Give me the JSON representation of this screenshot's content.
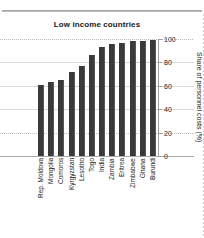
{
  "chart_data": {
    "type": "bar",
    "title": "Low income countries",
    "xlabel": "",
    "ylabel": "Share of personnel costs (%)",
    "ylim": [
      0,
      100
    ],
    "yticks": [
      0,
      20,
      40,
      60,
      80,
      100
    ],
    "grid": true,
    "legend": "none",
    "orientation": "vertical",
    "bar_color": "#3a3a3a",
    "categories": [
      "Rep. Moldova",
      "Mongolia",
      "Comoros",
      "Kyrgyzstan",
      "Lesotho",
      "Togo",
      "India",
      "Zambia",
      "Eritrea",
      "Zimbabwe",
      "Ghana",
      "Burundi"
    ],
    "values": [
      61,
      63,
      65,
      72,
      77,
      86,
      93,
      96,
      97,
      98,
      98.5,
      99.5
    ]
  },
  "colors": {
    "bar": "#3a3a3a",
    "grid": "#d8d8d8",
    "axis": "#9c9c9c",
    "text": "#1b1b1b",
    "background": "#ffffff"
  }
}
